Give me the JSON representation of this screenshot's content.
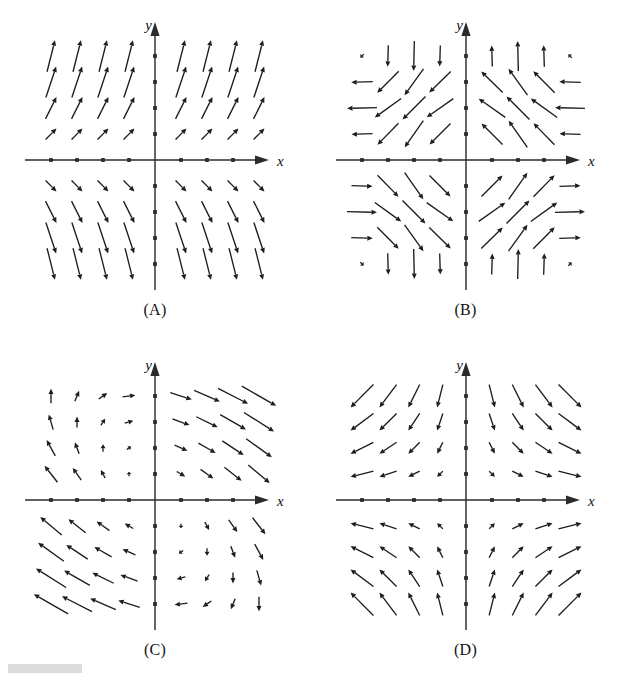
{
  "figure": {
    "panel_count": 4,
    "background_color": "#ffffff",
    "ink_color": "#1d1d1d",
    "axis_color": "#2b2b2b"
  },
  "axes": {
    "x_label": "x",
    "y_label": "y",
    "x_min": -4.5,
    "x_max": 4.5,
    "y_min": -4.5,
    "y_max": 4.5,
    "tick_values": [
      -4,
      -3,
      -2,
      -1,
      1,
      2,
      3,
      4
    ],
    "tick_style": "dot",
    "grid": false,
    "arrowheads": [
      "x-positive",
      "y-positive"
    ]
  },
  "panels": [
    {
      "id": "A",
      "caption": "(A)",
      "position": "top-left",
      "field_name": "shear-field",
      "field_expression": "F(x, y) = (1, y)",
      "description": "Arrows tilt up-and-right above the x-axis and down-and-right below it; they are nearly horizontal close to the x-axis and steepen with distance from it."
    },
    {
      "id": "B",
      "caption": "(B)",
      "position": "top-right",
      "field_name": "circulation-cell-field",
      "field_expression": "F(x, y) = (-y, x) cell pattern",
      "description": "Rotational cell pattern: arrows point left in the upper-left region, up in the upper-right region, down in the lower-left region and right in the lower-right region."
    },
    {
      "id": "C",
      "caption": "(C)",
      "position": "bottom-left",
      "field_name": "saddle-field",
      "field_expression": "F(x, y) = (y - x, -x - y) style saddle",
      "description": "Arrows sweep down-right in the upper-right quadrant and up-right in the lower-left quadrant, with short rotating arrows near the axes."
    },
    {
      "id": "D",
      "caption": "(D)",
      "position": "bottom-right",
      "field_name": "radial-saddle-field",
      "field_expression": "F(x, y) = (x, -y)",
      "description": "Arrows move away from the y-axis horizontally and toward the x-axis vertically, forming a saddle centered at the origin."
    }
  ],
  "chart_data": {
    "type": "scatter",
    "xlabel": "x",
    "ylabel": "y",
    "xlim": [
      -4.5,
      4.5
    ],
    "ylim": [
      -4.5,
      4.5
    ],
    "grid": false,
    "legend": "none",
    "sample_points_x": [
      -4,
      -3,
      -2,
      -1,
      1,
      2,
      3,
      4
    ],
    "sample_points_y": [
      -4,
      -3,
      -2,
      -1,
      1,
      2,
      3,
      4
    ],
    "series": [
      {
        "name": "A",
        "formula": "u = 1, v = y",
        "scale": 0.42,
        "max_len": 1.25
      },
      {
        "name": "B",
        "formula": "u = -sin(0.78*y), v = sin(0.78*x)",
        "scale": 1.15,
        "max_len": 1.25
      },
      {
        "name": "C",
        "formula": "u = 0.55*(x + y), v = -0.55*(x + 0.15*y)",
        "scale": 0.3,
        "max_len": 1.7
      },
      {
        "name": "D",
        "formula": "u = x, v = -y",
        "scale": 0.22,
        "max_len": 1.25
      }
    ]
  },
  "footer": {
    "mark": "redaction-bar"
  }
}
